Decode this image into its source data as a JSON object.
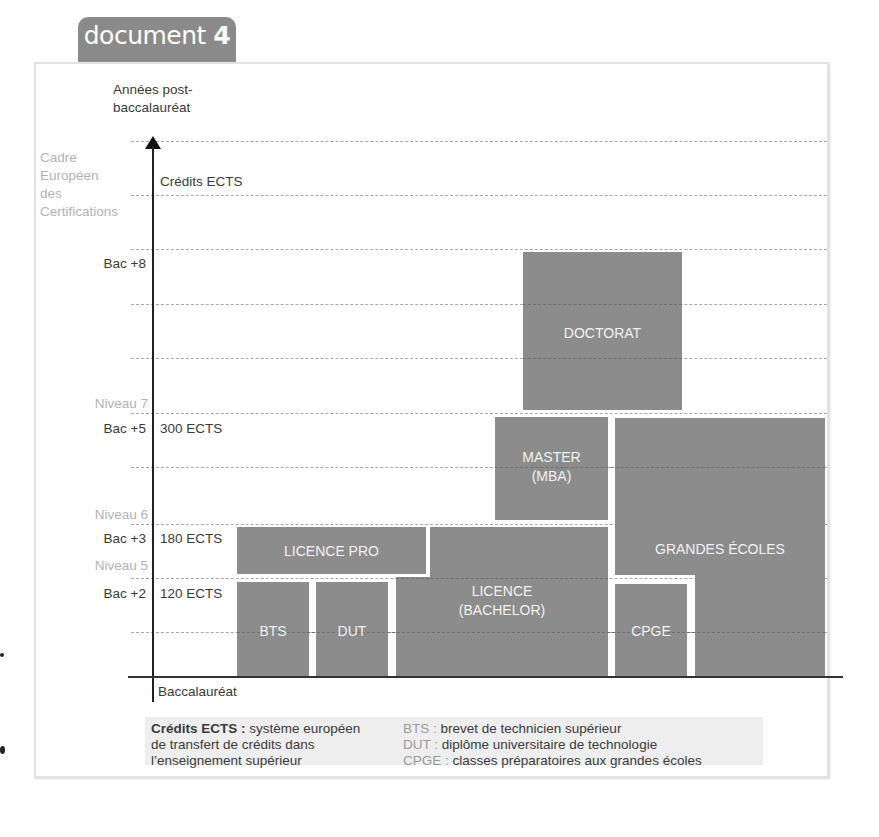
{
  "document_tab": {
    "word": "document",
    "number": "4"
  },
  "axis": {
    "y_title_line1": "Années post-",
    "y_title_line2": "baccalauréat",
    "cec_line1": "Cadre",
    "cec_line2": "Européen",
    "cec_line3": "des",
    "cec_line4": "Certifications",
    "credits_title": "Crédits ECTS",
    "origin_label": "Baccalauréat"
  },
  "rows": [
    {
      "years": "Bac +8",
      "ects": ""
    },
    {
      "years": "Bac +5",
      "ects": "300 ECTS"
    },
    {
      "years": "Bac +3",
      "ects": "180 ECTS"
    },
    {
      "years": "Bac +2",
      "ects": "120 ECTS"
    }
  ],
  "levels": [
    "Niveau 7",
    "Niveau 6",
    "Niveau 5"
  ],
  "programs": {
    "doctorat": "DOCTORAT",
    "master_line1": "MASTER",
    "master_line2": "(MBA)",
    "grandes_ecoles": "GRANDES ÉCOLES",
    "licence_pro": "LICENCE PRO",
    "licence_line1": "LICENCE",
    "licence_line2": "(BACHELOR)",
    "bts": "BTS",
    "dut": "DUT",
    "cpge": "CPGE"
  },
  "program_spans_years": {
    "bts": [
      0,
      2
    ],
    "dut": [
      0,
      2
    ],
    "licence": [
      0,
      3
    ],
    "licence_pro": [
      2,
      3
    ],
    "master": [
      3,
      5
    ],
    "cpge": [
      0,
      2
    ],
    "grandes_ecoles": [
      0,
      5
    ],
    "doctorat": [
      5,
      8
    ]
  },
  "legend": {
    "ects_key": "Crédits ECTS :",
    "ects_def1": " système européen",
    "ects_def2": "de transfert de crédits dans",
    "ects_def3": "l’enseignement supérieur",
    "bts_key": "BTS :",
    "bts_def": " brevet de technicien supérieur",
    "dut_key": "DUT :",
    "dut_def": " diplôme universitaire de technologie",
    "cpge_key": "CPGE :",
    "cpge_def": " classes préparatoires aux grandes écoles"
  },
  "colors": {
    "box": "#8c8c8c",
    "tab": "#8a8a8a",
    "level_text": "#b3b3b3",
    "legend_bg": "#eeeeee"
  }
}
